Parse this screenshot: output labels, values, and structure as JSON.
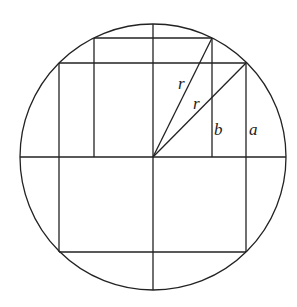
{
  "diagram": {
    "type": "geometry",
    "circle": {
      "cx": 153,
      "cy": 157,
      "r": 133
    },
    "labels": [
      {
        "id": "r_upper",
        "text": "r",
        "x": 178,
        "y": 89
      },
      {
        "id": "r_lower",
        "text": "r",
        "x": 193,
        "y": 109
      },
      {
        "id": "b",
        "text": "b",
        "x": 213,
        "y": 135
      },
      {
        "id": "a",
        "text": "a",
        "x": 248,
        "y": 135
      }
    ],
    "stroke_color": "#222222"
  }
}
